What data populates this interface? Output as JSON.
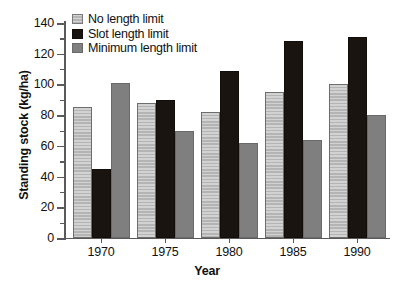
{
  "chart_data": {
    "type": "bar",
    "title": "",
    "xlabel": "Year",
    "ylabel": "Standing stock (kg/ha)",
    "categories": [
      "1970",
      "1975",
      "1980",
      "1985",
      "1990"
    ],
    "series": [
      {
        "name": "No length limit",
        "color": "#c4c4c4",
        "values": [
          85,
          88,
          82,
          95,
          100
        ]
      },
      {
        "name": "Slot length limit",
        "color": "#191410",
        "values": [
          45,
          90,
          109,
          128,
          131
        ]
      },
      {
        "name": "Minimum length limit",
        "color": "#7f7f7f",
        "values": [
          101,
          70,
          62,
          64,
          80
        ]
      }
    ],
    "ylim": [
      0,
      140
    ],
    "ytick_labels": [
      "0",
      "20",
      "40",
      "60",
      "80",
      "100",
      "120",
      "140"
    ],
    "ytick_values": [
      0,
      20,
      40,
      60,
      80,
      100,
      120,
      140
    ],
    "yminor_interval": 10,
    "grid": false,
    "legend_position": "top-left"
  },
  "legend": {
    "items": [
      {
        "label": "No length limit",
        "swatch": "hatched-light-gray-swatch"
      },
      {
        "label": "Slot length limit",
        "swatch": "black-swatch"
      },
      {
        "label": "Minimum length limit",
        "swatch": "medium-gray-swatch"
      }
    ]
  }
}
